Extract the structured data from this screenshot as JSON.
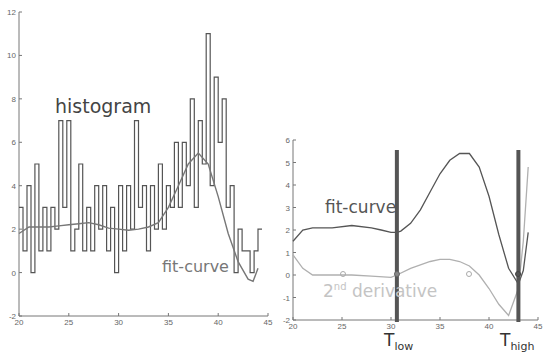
{
  "chart_data": [
    {
      "type": "line",
      "title": "",
      "annotations": [
        "histogram",
        "fit-curve"
      ],
      "xlabel": "",
      "ylabel": "",
      "xlim": [
        20,
        45
      ],
      "ylim": [
        -2,
        12
      ],
      "x_ticks": [
        20,
        25,
        30,
        35,
        40,
        45
      ],
      "y_ticks": [
        -2,
        0,
        2,
        4,
        6,
        8,
        10,
        12
      ],
      "grid": false,
      "series": [
        {
          "name": "histogram",
          "color": "#555555",
          "x": [
            20.2,
            20.6,
            21,
            21.4,
            21.8,
            22.2,
            22.6,
            23,
            23.4,
            23.8,
            24.2,
            24.6,
            25,
            25.4,
            25.8,
            26.2,
            26.6,
            27,
            27.4,
            27.8,
            28.2,
            28.6,
            29,
            29.4,
            29.8,
            30.2,
            30.6,
            31,
            31.4,
            31.8,
            32.2,
            32.6,
            33,
            33.4,
            33.8,
            34.2,
            34.6,
            35,
            35.4,
            35.8,
            36.2,
            36.6,
            37,
            37.4,
            37.8,
            38.2,
            38.6,
            39,
            39.4,
            39.8,
            40.2,
            40.6,
            41,
            41.4,
            41.8,
            42.2,
            42.6,
            43,
            43.4,
            43.8,
            44.2
          ],
          "y": [
            3,
            1,
            4,
            0,
            5,
            1,
            3,
            1,
            3,
            2,
            7,
            3,
            7,
            1,
            2,
            5,
            1,
            3,
            1,
            4,
            2,
            4,
            1,
            3,
            0,
            4,
            1,
            4,
            2,
            7,
            3,
            4,
            1,
            4,
            2,
            5,
            2,
            4,
            3,
            6,
            3,
            6,
            4,
            8,
            3,
            7,
            5,
            11,
            4,
            9,
            6,
            8,
            3,
            4,
            0,
            2,
            1,
            1,
            0,
            1,
            2
          ]
        },
        {
          "name": "fit-curve",
          "color": "#666666",
          "x": [
            20,
            21,
            22,
            23,
            24,
            25,
            26,
            27,
            28,
            29,
            30,
            31,
            32,
            33,
            34,
            35,
            36,
            37,
            38,
            39,
            40,
            41,
            42,
            43,
            43.5,
            44
          ],
          "y": [
            1.8,
            2.1,
            2.1,
            2.1,
            2.15,
            2.2,
            2.25,
            2.3,
            2.2,
            2.05,
            2.0,
            1.95,
            2.0,
            2.1,
            2.3,
            3.0,
            4.0,
            5.0,
            5.5,
            5.0,
            3.5,
            1.8,
            0.5,
            -0.3,
            -0.4,
            0.2
          ]
        }
      ]
    },
    {
      "type": "line",
      "title": "",
      "annotations": [
        "fit-curve",
        "2nd derivative",
        "T_low",
        "T_high"
      ],
      "xlabel": "",
      "ylabel": "",
      "xlim": [
        20,
        45
      ],
      "ylim": [
        -2,
        6
      ],
      "x_ticks": [
        20,
        25,
        30,
        35,
        40,
        45
      ],
      "y_ticks": [
        -2,
        -1,
        0,
        1,
        2,
        3,
        4,
        5,
        6
      ],
      "grid": false,
      "vertical_markers": [
        {
          "label": "T_low",
          "x": 30.6
        },
        {
          "label": "T_high",
          "x": 43.0
        }
      ],
      "series": [
        {
          "name": "fit-curve",
          "color": "#555555",
          "x": [
            20,
            21,
            22,
            24,
            26,
            28,
            29,
            30,
            30.6,
            31,
            32,
            33,
            34,
            35,
            36,
            37,
            38,
            39,
            40,
            41,
            42,
            43,
            43.5,
            44
          ],
          "y": [
            1.5,
            2.0,
            2.1,
            2.1,
            2.2,
            2.1,
            2.0,
            1.9,
            1.9,
            1.95,
            2.3,
            2.9,
            3.7,
            4.5,
            5.1,
            5.4,
            5.4,
            4.8,
            3.5,
            1.8,
            0.3,
            -0.4,
            0.2,
            1.9
          ]
        },
        {
          "name": "2nd derivative",
          "color": "#aaaaaa",
          "x": [
            20,
            21,
            22,
            24,
            26,
            28,
            30,
            30.6,
            32,
            34,
            35,
            36,
            37,
            38,
            39,
            40,
            41,
            42,
            43,
            43.5,
            44
          ],
          "y": [
            0.9,
            0.3,
            0.0,
            0.0,
            0.0,
            -0.05,
            -0.1,
            0.0,
            0.3,
            0.6,
            0.7,
            0.7,
            0.6,
            0.4,
            0.0,
            -0.6,
            -1.3,
            -1.8,
            -0.6,
            1.5,
            4.8
          ]
        }
      ]
    }
  ],
  "labels": {
    "histogram": "histogram",
    "fit_curve_left": "fit-curve",
    "fit_curve_right": "fit-curve",
    "second_derivative_num": "2",
    "second_derivative_sup": "nd",
    "second_derivative_word": " derivative",
    "t_low_main": "T",
    "t_low_sub": "low",
    "t_high_main": "T",
    "t_high_sub": "high"
  },
  "left_axis": {
    "x_ticks": [
      "20",
      "25",
      "30",
      "35",
      "40",
      "45"
    ],
    "y_ticks": [
      "-2",
      "0",
      "2",
      "4",
      "6",
      "8",
      "10",
      "12"
    ]
  },
  "right_axis": {
    "x_ticks": [
      "20",
      "25",
      "30",
      "35",
      "40",
      "45"
    ],
    "y_ticks": [
      "-2",
      "-1",
      "0",
      "1",
      "2",
      "3",
      "4",
      "5",
      "6"
    ]
  }
}
